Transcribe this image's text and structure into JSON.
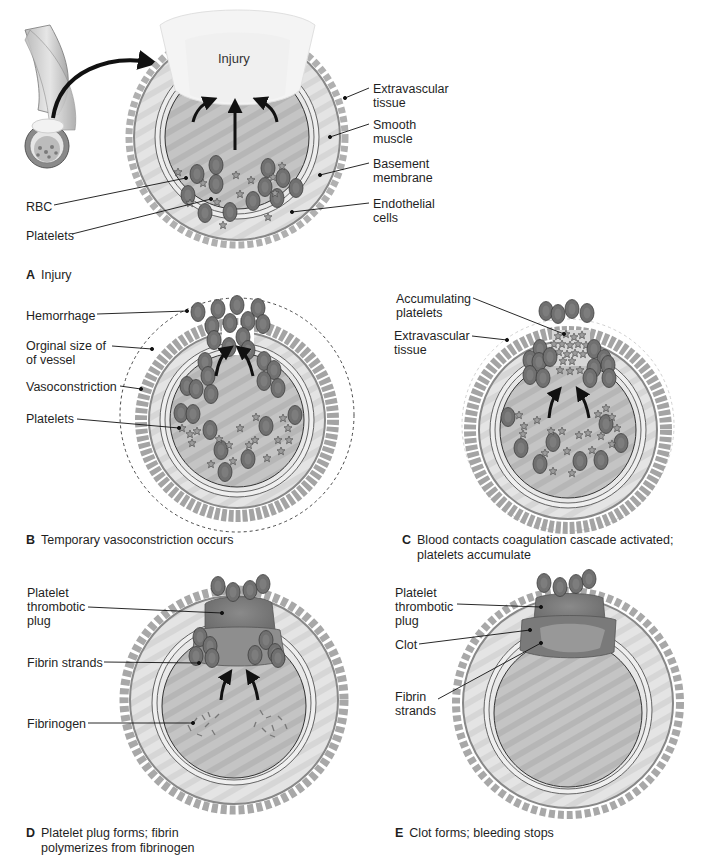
{
  "figure": {
    "colors": {
      "background": "#ffffff",
      "vessel_wall": "#d8d8d8",
      "lumen": "#bdbdbd",
      "rbc": "#6e6e6e",
      "platelet": "#9a9a9a",
      "tissue_strands": "#a8a8a8",
      "plug": "#7a7a7a",
      "text": "#1f1f1f",
      "arrow": "#111111"
    },
    "panels": [
      {
        "id": "A",
        "letter": "A",
        "caption": "Injury",
        "center_label": "Injury",
        "labels": [
          "Extravascular tissue",
          "Smooth muscle",
          "Basement membrane",
          "Endothelial cells",
          "RBC",
          "Platelets"
        ]
      },
      {
        "id": "B",
        "letter": "B",
        "caption": "Temporary vasoconstriction occurs",
        "labels": [
          "Hemorrhage",
          "Orginal size of of vessel",
          "Vasoconstriction",
          "Platelets"
        ]
      },
      {
        "id": "C",
        "letter": "C",
        "caption_line1": "Blood contacts coagulation cascade activated;",
        "caption_line2": "platelets accumulate",
        "labels": [
          "Accumulating platelets",
          "Extravascular tissue"
        ]
      },
      {
        "id": "D",
        "letter": "D",
        "caption_line1": "Platelet plug forms; fibrin",
        "caption_line2": "polymerizes from fibrinogen",
        "labels": [
          "Platelet thrombotic plug",
          "Fibrin strands",
          "Fibrinogen"
        ]
      },
      {
        "id": "E",
        "letter": "E",
        "caption": "Clot forms; bleeding stops",
        "labels": [
          "Platelet thrombotic plug",
          "Clot",
          "Fibrin strands"
        ]
      }
    ]
  },
  "labels": {
    "a_injury": "Injury",
    "a_extravascular_1": "Extravascular",
    "a_extravascular_2": "tissue",
    "a_smooth_1": "Smooth",
    "a_smooth_2": "muscle",
    "a_basement_1": "Basement",
    "a_basement_2": "membrane",
    "a_endothelial_1": "Endothelial",
    "a_endothelial_2": "cells",
    "a_rbc": "RBC",
    "a_platelets": "Platelets",
    "b_hemorrhage": "Hemorrhage",
    "b_original_1": "Orginal size of",
    "b_original_2": "of vessel",
    "b_vasoconstriction": "Vasoconstriction",
    "b_platelets": "Platelets",
    "c_accum_1": "Accumulating",
    "c_accum_2": "platelets",
    "c_extravascular_1": "Extravascular",
    "c_extravascular_2": "tissue",
    "d_plug_1": "Platelet",
    "d_plug_2": "thrombotic",
    "d_plug_3": "plug",
    "d_fibrin": "Fibrin strands",
    "d_fibrinogen": "Fibrinogen",
    "e_plug_1": "Platelet",
    "e_plug_2": "thrombotic",
    "e_plug_3": "plug",
    "e_clot": "Clot",
    "e_fibrin_1": "Fibrin",
    "e_fibrin_2": "strands"
  },
  "captions": {
    "a_letter": "A",
    "a_text": "Injury",
    "b_letter": "B",
    "b_text": "Temporary vasoconstriction occurs",
    "c_letter": "C",
    "c_text_1": "Blood contacts coagulation cascade activated;",
    "c_text_2": "platelets accumulate",
    "d_letter": "D",
    "d_text_1": "Platelet plug forms; fibrin",
    "d_text_2": "polymerizes from fibrinogen",
    "e_letter": "E",
    "e_text": "Clot forms; bleeding stops"
  }
}
